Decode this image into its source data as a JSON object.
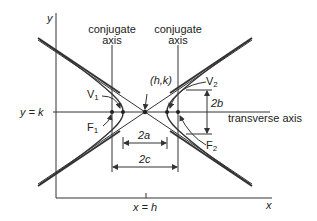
{
  "diagram": {
    "axes": {
      "x_label": "x",
      "y_label": "y"
    },
    "labels": {
      "conjugate_left_line1": "conjugate",
      "conjugate_left_line2": "axis",
      "conjugate_right_line1": "conjugate",
      "conjugate_right_line2": "axis",
      "center": "(h,k)",
      "v1": "V",
      "v1_sub": "1",
      "v2": "V",
      "v2_sub": "2",
      "f1": "F",
      "f1_sub": "1",
      "f2": "F",
      "f2_sub": "2",
      "two_a": "2a",
      "two_b": "2b",
      "two_c": "2c",
      "y_eq_k": "y = k",
      "x_eq_h": "x = h",
      "transverse_axis": "transverse axis"
    },
    "colors": {
      "line": "#333333",
      "background": "#ffffff"
    }
  }
}
